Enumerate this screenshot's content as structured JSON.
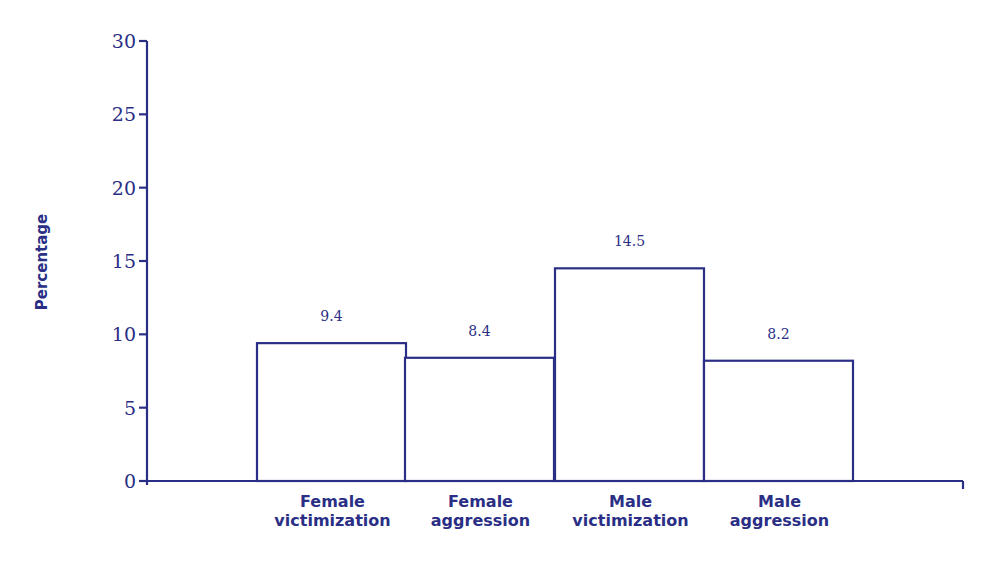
{
  "chart_data": {
    "type": "bar",
    "title": "",
    "xlabel": "",
    "ylabel": "Percentage",
    "ylim": [
      0,
      30
    ],
    "yticks": [
      0,
      5,
      10,
      15,
      20,
      25,
      30
    ],
    "grid": false,
    "legend": null,
    "categories": [
      [
        "Female",
        "victimization"
      ],
      [
        "Female",
        "aggression"
      ],
      [
        "Male",
        "victimization"
      ],
      [
        "Male",
        "aggression"
      ]
    ],
    "values": [
      9.4,
      8.4,
      14.5,
      8.2
    ],
    "value_labels": [
      "9.4",
      "8.4",
      "14.5",
      "8.2"
    ],
    "colors": {
      "stroke": "#2a2f85",
      "fill": "#ffffff"
    }
  }
}
